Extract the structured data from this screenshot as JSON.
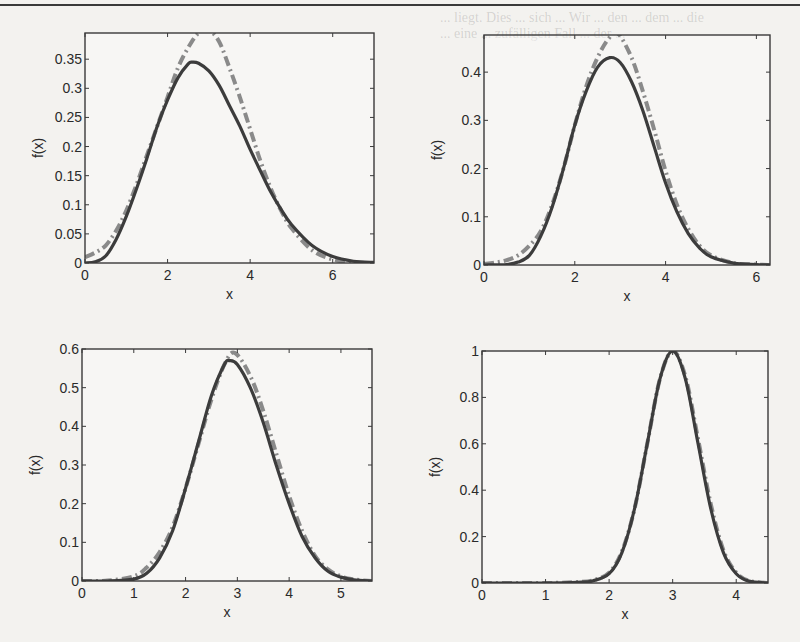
{
  "page": {
    "bleed_through_text": [
      "... liegt. Dies ... sich ... Wir ... den ... dem ... die",
      "... eine ... zufälligen Fall ... der ..."
    ]
  },
  "chart_data": [
    {
      "type": "line",
      "panel": "top-left",
      "title": "",
      "xlabel": "x",
      "ylabel": "f(x)",
      "xlim": [
        0,
        7
      ],
      "ylim": [
        0,
        0.395
      ],
      "xticks": [
        0,
        2,
        4,
        6
      ],
      "xtick_labels": [
        "0",
        "2",
        "4",
        "6"
      ],
      "yticks": [
        0,
        0.05,
        0.1,
        0.15,
        0.2,
        0.25,
        0.3,
        0.35
      ],
      "ytick_labels": [
        "0",
        "0.05",
        "0.1",
        "0.15",
        "0.2",
        "0.25",
        "0.3",
        "0.35"
      ],
      "grid": false,
      "series": [
        {
          "name": "solid",
          "style": "solid",
          "color": "#3c3c3c",
          "x": [
            0,
            0.25,
            0.5,
            0.75,
            1,
            1.25,
            1.5,
            1.75,
            2,
            2.25,
            2.5,
            2.6,
            2.75,
            3,
            3.25,
            3.5,
            3.75,
            4,
            4.25,
            4.5,
            4.75,
            5,
            5.5,
            6,
            6.5,
            7
          ],
          "y": [
            0,
            0.002,
            0.012,
            0.04,
            0.08,
            0.128,
            0.18,
            0.235,
            0.28,
            0.318,
            0.342,
            0.345,
            0.343,
            0.33,
            0.305,
            0.27,
            0.235,
            0.195,
            0.158,
            0.122,
            0.092,
            0.066,
            0.03,
            0.011,
            0.003,
            0.001
          ]
        },
        {
          "name": "dash-dot",
          "style": "dashdot",
          "color": "#8a8a8a",
          "x": [
            0,
            0.25,
            0.5,
            0.75,
            1,
            1.25,
            1.5,
            1.75,
            2,
            2.25,
            2.5,
            2.75,
            3,
            3.25,
            3.5,
            3.75,
            4,
            4.25,
            4.5,
            4.75,
            5,
            5.5,
            6,
            6.5,
            7
          ],
          "y": [
            0.01,
            0.018,
            0.03,
            0.055,
            0.09,
            0.135,
            0.185,
            0.235,
            0.285,
            0.335,
            0.37,
            0.395,
            0.4,
            0.38,
            0.335,
            0.285,
            0.23,
            0.175,
            0.128,
            0.09,
            0.06,
            0.022,
            0.006,
            0.001,
            0
          ]
        }
      ]
    },
    {
      "type": "line",
      "panel": "top-right",
      "title": "",
      "xlabel": "x",
      "ylabel": "f(x)",
      "xlim": [
        0,
        6.3
      ],
      "ylim": [
        0,
        0.477
      ],
      "xticks": [
        0,
        2,
        4,
        6
      ],
      "xtick_labels": [
        "0",
        "2",
        "4",
        "6"
      ],
      "yticks": [
        0,
        0.1,
        0.2,
        0.3,
        0.4
      ],
      "ytick_labels": [
        "0",
        "0.1",
        "0.2",
        "0.3",
        "0.4"
      ],
      "grid": false,
      "series": [
        {
          "name": "solid",
          "style": "solid",
          "color": "#3c3c3c",
          "x": [
            0,
            0.5,
            0.75,
            1,
            1.25,
            1.5,
            1.75,
            2,
            2.25,
            2.5,
            2.77,
            3,
            3.25,
            3.5,
            3.75,
            4,
            4.25,
            4.5,
            4.75,
            5,
            5.5,
            6,
            6.3
          ],
          "y": [
            0,
            0.001,
            0.006,
            0.02,
            0.06,
            0.12,
            0.2,
            0.29,
            0.36,
            0.41,
            0.43,
            0.42,
            0.38,
            0.32,
            0.245,
            0.17,
            0.11,
            0.065,
            0.035,
            0.017,
            0.004,
            0.001,
            0
          ]
        },
        {
          "name": "dash-dot",
          "style": "dashdot",
          "color": "#8a8a8a",
          "x": [
            0,
            0.25,
            0.5,
            0.75,
            1,
            1.25,
            1.5,
            1.75,
            2,
            2.25,
            2.5,
            2.75,
            2.95,
            3.25,
            3.5,
            3.75,
            4,
            4.25,
            4.5,
            4.75,
            5,
            5.5,
            6,
            6.3
          ],
          "y": [
            0.002,
            0.005,
            0.01,
            0.02,
            0.04,
            0.07,
            0.125,
            0.2,
            0.29,
            0.37,
            0.43,
            0.47,
            0.48,
            0.43,
            0.36,
            0.28,
            0.195,
            0.125,
            0.075,
            0.04,
            0.02,
            0.004,
            0.001,
            0
          ]
        }
      ]
    },
    {
      "type": "line",
      "panel": "bottom-left",
      "title": "",
      "xlabel": "x",
      "ylabel": "f(x)",
      "xlim": [
        0,
        5.6
      ],
      "ylim": [
        0,
        0.6
      ],
      "xticks": [
        0,
        1,
        2,
        3,
        4,
        5
      ],
      "xtick_labels": [
        "0",
        "1",
        "2",
        "3",
        "4",
        "5"
      ],
      "yticks": [
        0,
        0.1,
        0.2,
        0.3,
        0.4,
        0.5,
        0.6
      ],
      "ytick_labels": [
        "0",
        "0.1",
        "0.2",
        "0.3",
        "0.4",
        "0.5",
        "0.6"
      ],
      "grid": false,
      "series": [
        {
          "name": "solid",
          "style": "solid",
          "color": "#3c3c3c",
          "x": [
            0,
            0.5,
            1,
            1.25,
            1.5,
            1.75,
            2,
            2.25,
            2.5,
            2.75,
            2.85,
            3,
            3.25,
            3.5,
            3.75,
            4,
            4.25,
            4.5,
            4.75,
            5,
            5.25,
            5.6
          ],
          "y": [
            0,
            0,
            0.005,
            0.02,
            0.06,
            0.13,
            0.24,
            0.36,
            0.48,
            0.56,
            0.57,
            0.56,
            0.5,
            0.41,
            0.3,
            0.2,
            0.115,
            0.06,
            0.025,
            0.01,
            0.003,
            0
          ]
        },
        {
          "name": "dash-dot",
          "style": "dashdot",
          "color": "#8a8a8a",
          "x": [
            0,
            0.5,
            1,
            1.25,
            1.5,
            1.75,
            2,
            2.25,
            2.5,
            2.75,
            2.95,
            3.25,
            3.5,
            3.75,
            4,
            4.25,
            4.5,
            4.75,
            5,
            5.25,
            5.6
          ],
          "y": [
            0,
            0.001,
            0.012,
            0.035,
            0.075,
            0.14,
            0.24,
            0.355,
            0.47,
            0.56,
            0.59,
            0.53,
            0.44,
            0.33,
            0.22,
            0.13,
            0.065,
            0.03,
            0.012,
            0.004,
            0
          ]
        }
      ]
    },
    {
      "type": "line",
      "panel": "bottom-right",
      "title": "",
      "xlabel": "x",
      "ylabel": "f(x)",
      "xlim": [
        0,
        4.5
      ],
      "ylim": [
        0,
        1
      ],
      "xticks": [
        0,
        1,
        2,
        3,
        4
      ],
      "xtick_labels": [
        "0",
        "1",
        "2",
        "3",
        "4"
      ],
      "yticks": [
        0,
        0.2,
        0.4,
        0.6,
        0.8,
        1
      ],
      "ytick_labels": [
        "0",
        "0.2",
        "0.4",
        "0.6",
        "0.8",
        "1"
      ],
      "grid": false,
      "series": [
        {
          "name": "solid",
          "style": "solid",
          "color": "#3c3c3c",
          "x": [
            0,
            1,
            1.5,
            1.75,
            2,
            2.2,
            2.4,
            2.6,
            2.8,
            3,
            3.2,
            3.4,
            3.6,
            3.8,
            4,
            4.2,
            4.5
          ],
          "y": [
            0,
            0,
            0.003,
            0.01,
            0.04,
            0.13,
            0.32,
            0.6,
            0.88,
            1.0,
            0.88,
            0.6,
            0.32,
            0.13,
            0.04,
            0.008,
            0
          ]
        },
        {
          "name": "dash-dot",
          "style": "dashdot",
          "color": "#8a8a8a",
          "x": [
            0,
            1,
            1.5,
            1.75,
            2,
            2.2,
            2.4,
            2.6,
            2.8,
            3,
            3.2,
            3.4,
            3.6,
            3.8,
            4,
            4.2,
            4.5
          ],
          "y": [
            0,
            0,
            0.004,
            0.012,
            0.045,
            0.135,
            0.32,
            0.6,
            0.88,
            1.0,
            0.89,
            0.62,
            0.34,
            0.14,
            0.045,
            0.01,
            0
          ]
        }
      ]
    }
  ],
  "layout": {
    "panels": [
      {
        "left": 85,
        "top": 33,
        "width": 289,
        "height": 230
      },
      {
        "left": 484,
        "top": 35,
        "width": 286,
        "height": 230
      },
      {
        "left": 82,
        "top": 349,
        "width": 290,
        "height": 232
      },
      {
        "left": 482,
        "top": 351,
        "width": 286,
        "height": 232
      }
    ]
  }
}
